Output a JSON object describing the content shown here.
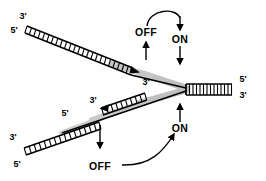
{
  "figure": {
    "name": "dna-replication-fork-diagram",
    "background_color": "#ffffff",
    "ink_color": "#000000",
    "template_shadow_color": "#9a9a9a"
  },
  "labels": {
    "off": "OFF",
    "on": "ON"
  },
  "prime_ends": {
    "upper_left_top": "3'",
    "upper_left_bottom": "5'",
    "upper_fragment_end": "3'",
    "lower_left_top": "3'",
    "lower_left_bottom": "5'",
    "lower_mid": "5'",
    "lower_fragment_end": "3'",
    "right_top": "5'",
    "right_bottom": "3'"
  },
  "states": {
    "upper_off": "OFF",
    "upper_on": "ON",
    "lower_on": "ON",
    "lower_off": "OFF"
  },
  "duplexes": {
    "upper_left_rungs": 24,
    "upper_fragment_rungs": 7,
    "lower_left_rungs": 15,
    "lower_fragment_rungs": 9,
    "right_rungs": 13
  }
}
